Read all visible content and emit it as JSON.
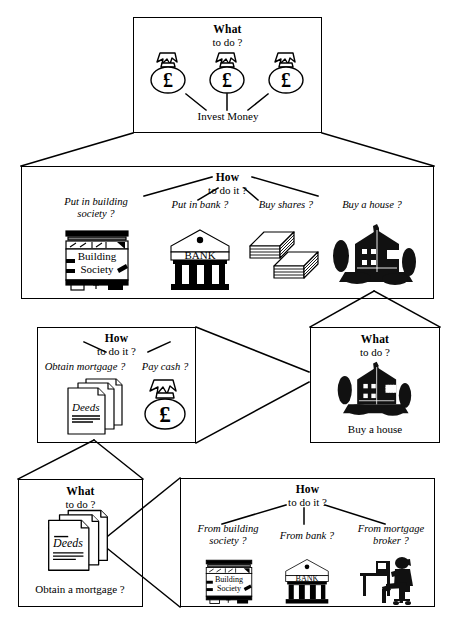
{
  "diagram": {
    "title_text": "What / How decision tree for investing money",
    "line_color": "#000000",
    "background": "#ffffff"
  },
  "boxes": [
    {
      "id": "what-invest-money",
      "kind": "what",
      "title": "What",
      "subtitle": "to do ?",
      "caption": "Invest Money",
      "icons": [
        "money-bag-icon",
        "money-bag-icon",
        "money-bag-icon"
      ]
    },
    {
      "id": "how-invest-money",
      "kind": "how",
      "title": "How",
      "subtitle": "to do it ?",
      "options": [
        {
          "label": "Put in building\nsociety ?",
          "icon": "building-society-icon"
        },
        {
          "label": "Put in bank ?",
          "icon": "bank-icon"
        },
        {
          "label": "Buy shares ?",
          "icon": "share-certificates-icon"
        },
        {
          "label": "Buy a house ?",
          "icon": "house-icon"
        }
      ]
    },
    {
      "id": "what-buy-a-house",
      "kind": "what",
      "title": "What",
      "subtitle": "to do ?",
      "caption": "Buy a house",
      "icons": [
        "house-icon"
      ]
    },
    {
      "id": "how-buy-a-house",
      "kind": "how",
      "title": "How",
      "subtitle": "to do it ?",
      "options": [
        {
          "label": "Obtain mortgage ?",
          "icon": "deeds-icon"
        },
        {
          "label": "Pay cash ?",
          "icon": "money-bag-icon"
        }
      ]
    },
    {
      "id": "what-obtain-a-mortgage",
      "kind": "what",
      "title": "What",
      "subtitle": "to do ?",
      "caption": "Obtain a mortgage ?",
      "icons": [
        "deeds-icon"
      ]
    },
    {
      "id": "how-obtain-a-mortgage",
      "kind": "how",
      "title": "How",
      "subtitle": "to do it ?",
      "options": [
        {
          "label": "From building\nsociety ?",
          "icon": "building-society-icon"
        },
        {
          "label": "From bank ?",
          "icon": "bank-icon"
        },
        {
          "label": "From mortgage\nbroker ?",
          "icon": "mortgage-broker-icon"
        }
      ]
    }
  ],
  "labels": {
    "deeds_text": "Deeds",
    "bank_text": "BANK",
    "building_text": "Building",
    "society_text": "Society",
    "pound_symbol": "£"
  }
}
